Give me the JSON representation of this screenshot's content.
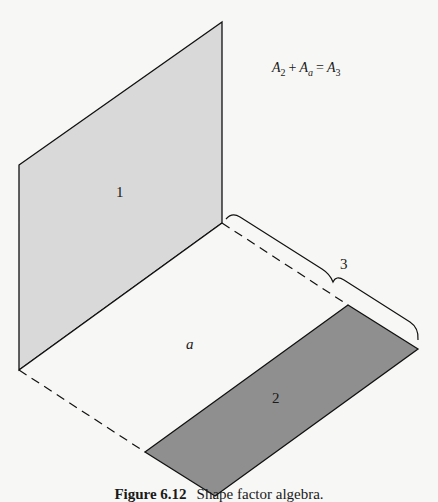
{
  "figure": {
    "equation": {
      "term1": "A",
      "term1_sub": "2",
      "plus": "+",
      "term2": "A",
      "term2_sub": "a",
      "equals": "=",
      "term3": "A",
      "term3_sub": "3"
    },
    "labels": {
      "region_1": "1",
      "region_a": "a",
      "region_2": "2",
      "brace_3": "3"
    },
    "colors": {
      "panel_1": "#d9d9d9",
      "panel_2": "#8f8f8f",
      "panel_a": "#f7f7f5",
      "stroke": "#111111"
    },
    "caption": {
      "number": "Figure 6.12",
      "text": "Shape factor algebra."
    }
  }
}
